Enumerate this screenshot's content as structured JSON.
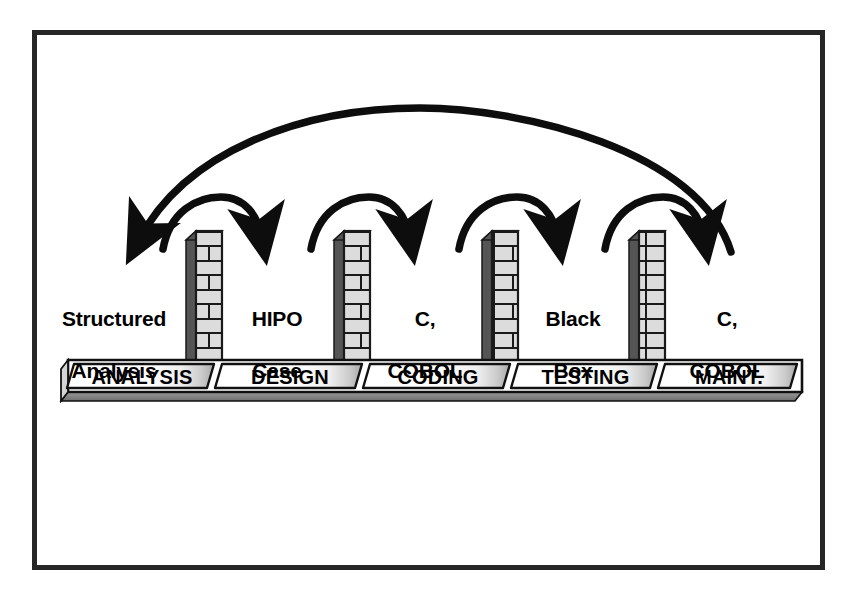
{
  "diagram": {
    "frame": {
      "border_color": "#262626"
    },
    "colors": {
      "ink": "#000000",
      "pillar_face": "#d9d9d9",
      "pillar_side": "#555555",
      "pillar_mortar": "#1a1a1a",
      "band_face": "#ffffff",
      "band_shadow": "#8a8a8a",
      "band_edge": "#000000",
      "background": "#ffffff"
    },
    "tools": [
      {
        "id": "analysis-tools",
        "text": "Structured\nAnalysis",
        "line1": "Structured",
        "line2": "Analysis"
      },
      {
        "id": "design-tools",
        "text": "HIPO\nCase",
        "line1": "HIPO",
        "line2": "Case"
      },
      {
        "id": "coding-tools",
        "text": "C,\nCOBOL",
        "line1": "C,",
        "line2": "COBOL"
      },
      {
        "id": "testing-tools",
        "text": "Black\nBox",
        "line1": "Black",
        "line2": "Box"
      },
      {
        "id": "maintenance-tools",
        "text": "C,\nCOBOL",
        "line1": "C,",
        "line2": "COBOL"
      }
    ],
    "phases": [
      {
        "id": "phase-analysis",
        "label": "ANALYSIS"
      },
      {
        "id": "phase-design",
        "label": "DESIGN"
      },
      {
        "id": "phase-coding",
        "label": "CODING"
      },
      {
        "id": "phase-testing",
        "label": "TESTING"
      },
      {
        "id": "phase-maint",
        "label": "MAINT."
      }
    ],
    "pillars": [
      {
        "id": "pillar-1",
        "brick_rows": 9
      },
      {
        "id": "pillar-2",
        "brick_rows": 9
      },
      {
        "id": "pillar-3",
        "brick_rows": 9
      },
      {
        "id": "pillar-4",
        "brick_rows": 9
      }
    ],
    "arrows": {
      "forward": [
        {
          "id": "arrow-analysis-to-design",
          "direction": "right"
        },
        {
          "id": "arrow-design-to-coding",
          "direction": "right"
        },
        {
          "id": "arrow-coding-to-testing",
          "direction": "right"
        },
        {
          "id": "arrow-testing-to-maint",
          "direction": "right"
        }
      ],
      "feedback": [
        {
          "id": "arrow-maint-to-analysis",
          "direction": "left"
        }
      ]
    }
  }
}
